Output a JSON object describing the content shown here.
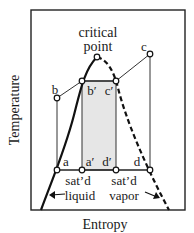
{
  "diagram": {
    "type": "T-s diagram (Carnot cycle inside vapor dome)",
    "axes": {
      "xlabel": "Entropy",
      "ylabel": "Temperature"
    },
    "annotations": {
      "critical_point_line1": "critical",
      "critical_point_line2": "point",
      "sat_liquid_line1": "sat’d",
      "sat_liquid_line2": "liquid",
      "sat_vapor_line1": "sat’d",
      "sat_vapor_line2": "vapor"
    },
    "points": {
      "a": "a",
      "a_prime": "a′",
      "b": "b",
      "b_prime": "b′",
      "c": "c",
      "c_prime": "c′",
      "d": "d",
      "d_prime": "d′"
    },
    "colors": {
      "line": "#1a1a1a",
      "shaded_region": "#e6e6e6",
      "background": "#ffffff"
    }
  }
}
